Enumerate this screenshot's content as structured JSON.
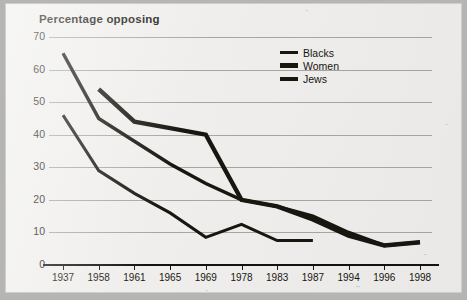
{
  "chart_data": {
    "type": "line",
    "title": "Percentage opposing",
    "xlabel": "",
    "ylabel": "",
    "ylim": [
      0,
      70
    ],
    "ytick_step": 10,
    "yticks": [
      0,
      10,
      20,
      30,
      40,
      50,
      60,
      70
    ],
    "grid": true,
    "legend_position": "top-center-right",
    "categories": [
      "1937",
      "1958",
      "1961",
      "1965",
      "1969",
      "1978",
      "1983",
      "1987",
      "1994",
      "1996",
      "1998"
    ],
    "series": [
      {
        "name": "Blacks",
        "x": [
          "1937",
          "1958",
          "1961",
          "1965",
          "1969",
          "1978",
          "1983",
          "1987",
          "1994",
          "1996",
          "1998"
        ],
        "values": [
          65,
          45,
          38,
          31,
          25,
          20,
          18,
          15,
          10,
          6,
          7
        ]
      },
      {
        "name": "Women",
        "x": [
          "1958",
          "1961",
          "1965",
          "1969",
          "1978",
          "1983",
          "1987",
          "1994",
          "1996",
          "1998"
        ],
        "values": [
          54,
          44,
          42,
          40,
          20,
          18,
          14,
          9,
          6,
          7
        ]
      },
      {
        "name": "Jews",
        "x": [
          "1937",
          "1958",
          "1961",
          "1965",
          "1969",
          "1978",
          "1983",
          "1987"
        ],
        "values": [
          46,
          29,
          22,
          16,
          8.5,
          12.5,
          7.5,
          7.5
        ]
      }
    ],
    "colors": {
      "line": "#17160f",
      "gridline": "#8f8e8b",
      "axis": "#121210",
      "background": "#efeeec"
    }
  },
  "legend": {
    "items": [
      {
        "label": "Blacks"
      },
      {
        "label": "Women"
      },
      {
        "label": "Jews"
      }
    ]
  }
}
